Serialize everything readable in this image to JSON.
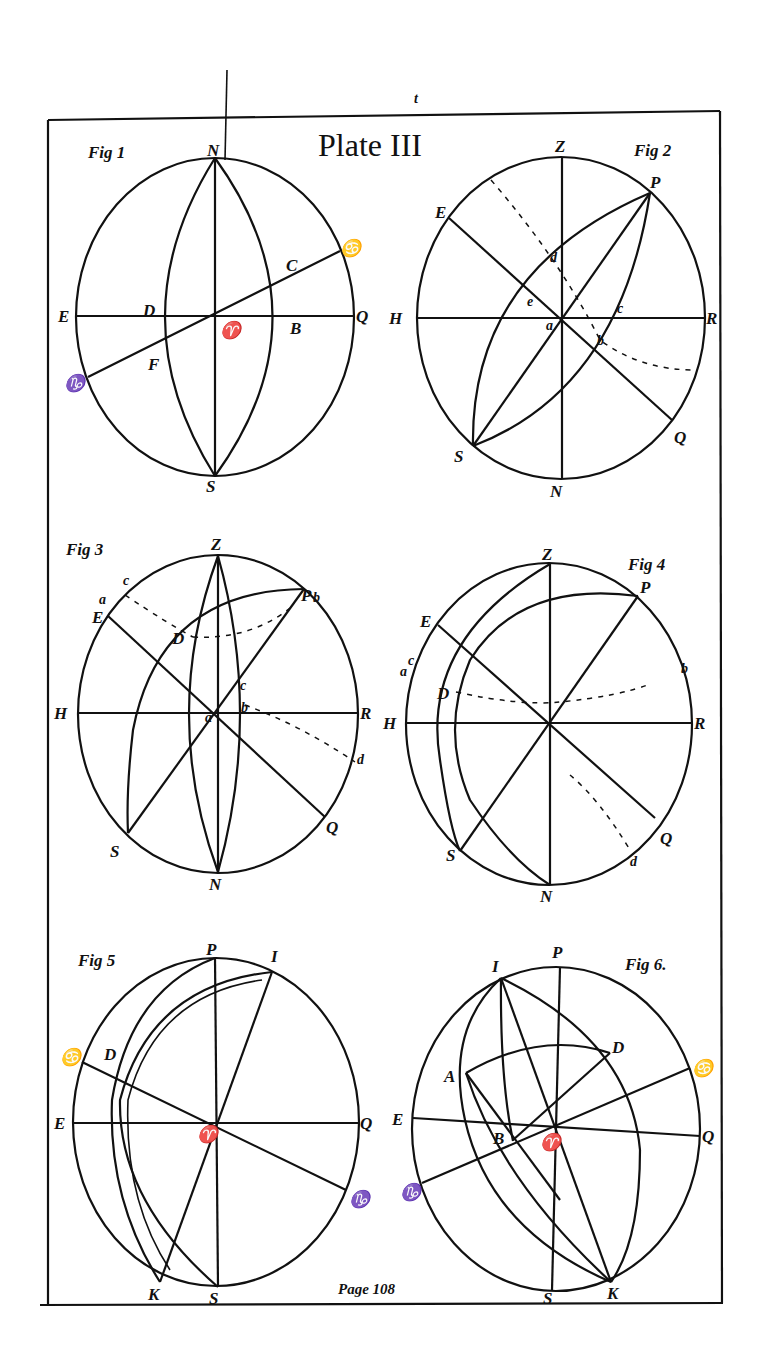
{
  "plate": {
    "title": "Plate III",
    "page_label": "Page 108",
    "top_mark": "t",
    "colors": {
      "ink": "#111111",
      "paper": "#ffffff"
    }
  },
  "figures": [
    {
      "id": "fig1",
      "caption": "Fig 1",
      "labels": {
        "top": "N",
        "bottom": "S",
        "left": "E",
        "right": "Q",
        "center": "♈",
        "ecl_right": "♋",
        "ecl_left": "♑",
        "D": "D",
        "B": "B",
        "C": "C",
        "F": "F"
      }
    },
    {
      "id": "fig2",
      "caption": "Fig 2",
      "labels": {
        "top": "Z",
        "bottom": "N",
        "left": "H",
        "right": "R",
        "P": "P",
        "S": "S",
        "E": "E",
        "Q": "Q",
        "a": "a",
        "b": "b",
        "c": "c",
        "d": "d",
        "e": "e"
      }
    },
    {
      "id": "fig3",
      "caption": "Fig 3",
      "labels": {
        "top": "Z",
        "bottom": "N",
        "left": "H",
        "right": "R",
        "P": "P",
        "pb": "b",
        "S": "S",
        "E": "E",
        "Q": "Q",
        "D": "D",
        "a": "a",
        "c_top": "c",
        "c": "c",
        "b": "b",
        "d": "d",
        "center": "a"
      }
    },
    {
      "id": "fig4",
      "caption": "Fig 4",
      "labels": {
        "top": "Z",
        "bottom": "N",
        "left": "H",
        "right": "R",
        "P": "P",
        "S": "S",
        "E": "E",
        "Q": "Q",
        "D": "D",
        "a": "a",
        "c": "c",
        "b": "b",
        "d": "d"
      }
    },
    {
      "id": "fig5",
      "caption": "Fig 5",
      "labels": {
        "top": "P",
        "bottom": "S",
        "left": "E",
        "right": "Q",
        "I": "I",
        "K": "K",
        "D": "D",
        "center": "♈",
        "cancer": "♋",
        "capricorn": "♑"
      }
    },
    {
      "id": "fig6",
      "caption": "Fig 6.",
      "labels": {
        "top": "P",
        "bottom": "S",
        "left": "E",
        "right": "Q",
        "I": "I",
        "K": "K",
        "A": "A",
        "D": "D",
        "B": "B",
        "center": "♈",
        "cancer": "♋",
        "capricorn": "♑"
      }
    }
  ]
}
